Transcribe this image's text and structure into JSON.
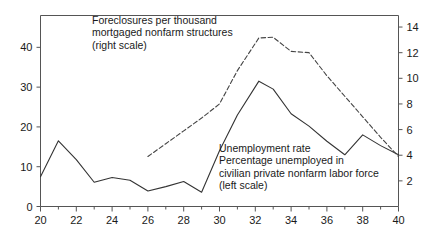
{
  "chart_data": {
    "type": "line",
    "title": "",
    "subtitle": "",
    "xlabel": "",
    "ylabel": "",
    "xlim": [
      20,
      40
    ],
    "ylim": [
      0,
      48
    ],
    "y2lim": [
      0,
      14.9
    ],
    "grid": false,
    "legend_position": "inline-annotations",
    "x_ticks": [
      20,
      22,
      24,
      26,
      28,
      30,
      32,
      34,
      36,
      38,
      40
    ],
    "x_minor_ticks": [
      21,
      23,
      25,
      27,
      29,
      31,
      33,
      35,
      37,
      39
    ],
    "y_ticks": [
      0,
      10,
      20,
      30,
      40
    ],
    "y2_ticks": [
      2,
      4,
      6,
      8,
      10,
      12,
      14
    ],
    "series": [
      {
        "name": "Unemployment rate",
        "axis": "left",
        "style": "solid",
        "color": "#333333",
        "x": [
          20,
          21,
          22,
          23,
          24,
          25,
          26,
          27,
          28,
          29,
          30,
          31,
          32.2,
          33,
          34,
          35,
          36,
          37,
          38,
          39,
          40
        ],
        "values": [
          7.5,
          16.5,
          11.8,
          6.1,
          7.3,
          6.6,
          3.9,
          5.0,
          6.3,
          3.6,
          14.0,
          23.0,
          31.5,
          29.5,
          23.3,
          20.2,
          16.4,
          13.0,
          18.0,
          15.3,
          13.0
        ]
      },
      {
        "name": "Foreclosures per thousand mortgaged nonfarm structures",
        "axis": "right",
        "style": "dashed",
        "color": "#444444",
        "x": [
          26,
          27,
          28,
          29,
          30,
          31,
          32.2,
          33,
          34,
          35,
          36,
          37,
          38,
          39,
          40
        ],
        "values": [
          3.9,
          4.9,
          5.9,
          6.9,
          8.0,
          10.6,
          13.15,
          13.2,
          12.1,
          12.0,
          10.2,
          8.6,
          7.0,
          5.4,
          3.9
        ]
      }
    ],
    "annotations": [
      {
        "name": "foreclosures-label",
        "lines": [
          "Foreclosures per thousand",
          "mortgaged nonfarm structures",
          "(right scale)"
        ]
      },
      {
        "name": "unemployment-label",
        "lines": [
          "Unemployment rate",
          "Percentage unemployed in",
          "civilian private nonfarm labor force",
          "(left scale)"
        ]
      }
    ]
  },
  "axes": {
    "left": {
      "labels": [
        "40",
        "30",
        "20",
        "10",
        "0"
      ]
    },
    "right": {
      "labels": [
        "14",
        "12",
        "10",
        "8",
        "6",
        "4",
        "2"
      ]
    },
    "bottom": {
      "labels": [
        "20",
        "22",
        "24",
        "26",
        "28",
        "30",
        "32",
        "34",
        "36",
        "38",
        "40"
      ]
    }
  },
  "annotation_text": {
    "foreclosures": {
      "line1": "Foreclosures per thousand",
      "line2": "mortgaged nonfarm structures",
      "line3": "(right scale)"
    },
    "unemployment": {
      "line1": "Unemployment rate",
      "line2": "Percentage unemployed in",
      "line3": "civilian private nonfarm labor force",
      "line4": "(left scale)"
    }
  },
  "colors": {
    "axis": "#555555",
    "solid_series": "#333333",
    "dashed_series": "#444444",
    "text": "#1a1a1a",
    "background": "#ffffff"
  }
}
